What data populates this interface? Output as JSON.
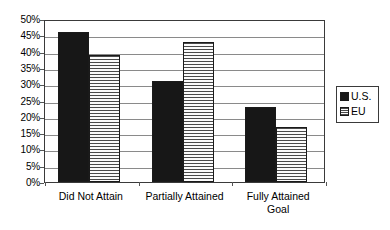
{
  "chart_data": {
    "type": "bar",
    "title": "",
    "subtitle": "",
    "xlabel": "",
    "ylabel": "",
    "categories": [
      "Did Not Attain",
      "Partially Attained",
      "Fully Attained Goal"
    ],
    "series": [
      {
        "name": "U.S.",
        "values": [
          46,
          31,
          23
        ],
        "color": "#171717",
        "fill": "solid-black"
      },
      {
        "name": "EU",
        "values": [
          39,
          43,
          17
        ],
        "color": "#f2f2f2",
        "fill": "horizontal-stripes"
      }
    ],
    "ylim": [
      0,
      50
    ],
    "ytick_step": 5,
    "ytick_labels": [
      "50%",
      "45%",
      "40%",
      "35%",
      "30%",
      "25%",
      "20%",
      "15%",
      "10%",
      "5%",
      "0%"
    ],
    "ytick_values": [
      50,
      45,
      40,
      35,
      30,
      25,
      20,
      15,
      10,
      5,
      0
    ],
    "value_suffix": "%",
    "grid": true,
    "grid_axis": "y",
    "legend": true,
    "legend_position": "right",
    "legend_entries": [
      "U.S.",
      "EU"
    ],
    "plot_border": true,
    "plot_background": "#ffffff",
    "axis_color": "#3a3a3a",
    "grid_color": "#8a8a8a"
  },
  "category_label_lines": [
    [
      "Did Not Attain"
    ],
    [
      "Partially Attained"
    ],
    [
      "Fully Attained",
      "Goal"
    ]
  ]
}
